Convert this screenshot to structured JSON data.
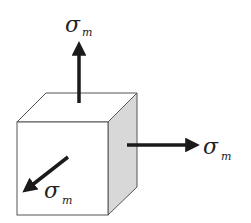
{
  "diagram": {
    "colors": {
      "edge": "#555555",
      "front_face": "#ffffff",
      "top_face": "#ffffff",
      "side_face": "#d8d8d8",
      "arrow": "#1a1a1a",
      "label": "#222222"
    },
    "cube": {
      "front": {
        "x1": 17,
        "y1": 122,
        "x2": 108,
        "y2": 215
      },
      "depth_offset": {
        "dx": 29,
        "dy": -29
      }
    },
    "arrows": [
      {
        "id": "up",
        "direction": "+y (up)",
        "label": "σ",
        "subscript": "m"
      },
      {
        "id": "right",
        "direction": "+x (right)",
        "label": "σ",
        "subscript": "m"
      },
      {
        "id": "front",
        "direction": "+z (out of page, diagonal down-left)",
        "label": "σ",
        "subscript": "m"
      }
    ],
    "labels": {
      "up": {
        "symbol": "σ",
        "subscript": "m"
      },
      "right": {
        "symbol": "σ",
        "subscript": "m"
      },
      "front": {
        "symbol": "σ",
        "subscript": "m"
      }
    }
  }
}
